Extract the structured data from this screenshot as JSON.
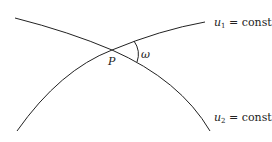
{
  "diagram": {
    "curves": [
      {
        "id": "u1",
        "var": "u",
        "sub": "1",
        "eq": " = const",
        "path": "M17,131 Q60,70 112,50 Q160,30 205,22"
      },
      {
        "id": "u2",
        "var": "u",
        "sub": "2",
        "eq": " = const",
        "path": "M15,18 Q70,32 112,50 Q180,80 210,131"
      }
    ],
    "point": {
      "label": "P"
    },
    "angle": {
      "label": "ω"
    },
    "stroke_color": "#222222"
  }
}
